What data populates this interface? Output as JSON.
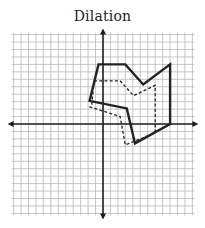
{
  "title": "Dilation",
  "colors": {
    "background": "#ffffff",
    "grid": "#b8b8b8",
    "axis": "#1a1a1a",
    "shape": "#222222"
  },
  "grid": {
    "origin_px": [
      103,
      124
    ],
    "unit_px": 7.45,
    "x_range": [
      -12,
      12
    ],
    "y_range": [
      -12,
      12
    ]
  },
  "figures": {
    "original": {
      "style": "solid",
      "vertices": [
        [
          -0.6,
          8
        ],
        [
          3,
          8
        ],
        [
          5.4,
          5.3
        ],
        [
          9,
          8
        ],
        [
          9,
          0
        ],
        [
          4.3,
          -2.6
        ],
        [
          3.2,
          2.1
        ],
        [
          -1.8,
          3.1
        ]
      ]
    },
    "image": {
      "style": "dashed",
      "vertices": [
        [
          -1.2,
          5.8
        ],
        [
          2.3,
          5.8
        ],
        [
          4.1,
          3.8
        ],
        [
          7,
          5.2
        ],
        [
          7,
          -1.2
        ],
        [
          3,
          -2.8
        ],
        [
          2.3,
          1
        ],
        [
          -1.75,
          2.3
        ],
        [
          -1.5,
          2.6
        ]
      ]
    }
  }
}
